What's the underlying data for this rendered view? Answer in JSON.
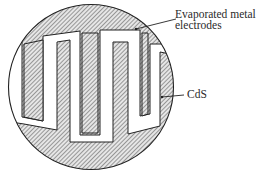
{
  "diagram": {
    "type": "interdigitated photoconductor (CdS cell) top view",
    "labels": {
      "electrodes_line1": "Evaporated metal",
      "electrodes_line2": "electrodes",
      "cds": "CdS"
    },
    "colors": {
      "outline": "#222222",
      "hatch": "#444444",
      "background": "#ffffff"
    }
  }
}
